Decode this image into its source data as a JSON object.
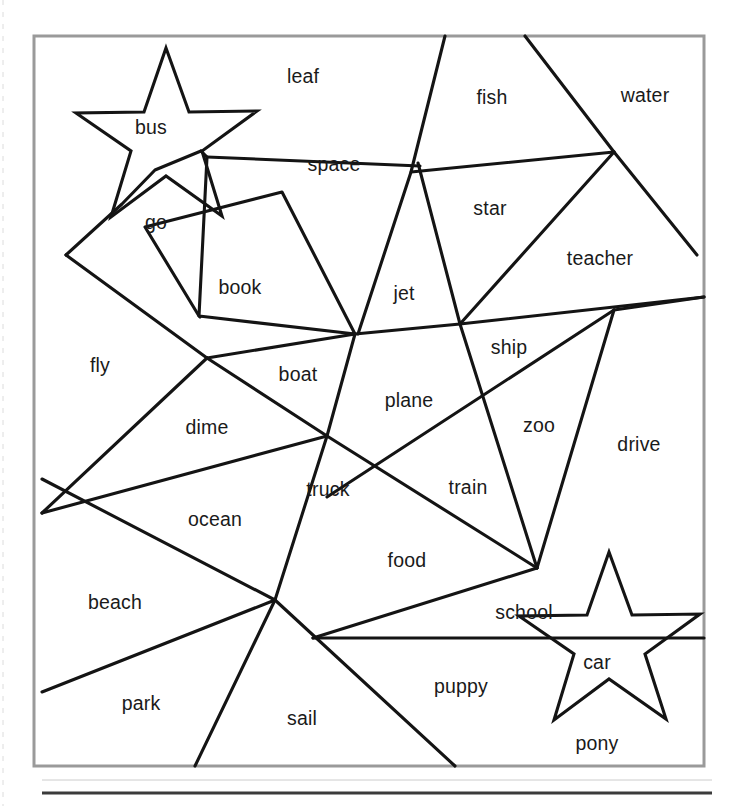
{
  "document": {
    "type": "worksheet",
    "title": "Shape Word Puzzle",
    "background_color": "#ffffff",
    "frame": {
      "x": 34,
      "y": 36,
      "width": 670,
      "height": 730,
      "stroke_color": "#9a9a9a",
      "stroke_width": 3
    },
    "line_color": "#141414",
    "line_width": 3.1,
    "text_color": "#1a1a1a",
    "footer_rule": {
      "x1": 42,
      "y1": 793,
      "x2": 712,
      "y2": 793,
      "color": "#3b3b3b"
    }
  },
  "words": [
    {
      "id": "bus",
      "label": "bus",
      "x": 151,
      "y": 129
    },
    {
      "id": "leaf",
      "label": "leaf",
      "x": 303,
      "y": 78
    },
    {
      "id": "fish",
      "label": "fish",
      "x": 492,
      "y": 99
    },
    {
      "id": "water",
      "label": "water",
      "x": 645,
      "y": 97
    },
    {
      "id": "space",
      "label": "space",
      "x": 334,
      "y": 166
    },
    {
      "id": "star",
      "label": "star",
      "x": 490,
      "y": 210
    },
    {
      "id": "teacher",
      "label": "teacher",
      "x": 600,
      "y": 260
    },
    {
      "id": "go",
      "label": "go",
      "x": 156,
      "y": 224
    },
    {
      "id": "book",
      "label": "book",
      "x": 240,
      "y": 289
    },
    {
      "id": "jet",
      "label": "jet",
      "x": 404,
      "y": 295
    },
    {
      "id": "ship",
      "label": "ship",
      "x": 509,
      "y": 349
    },
    {
      "id": "fly",
      "label": "fly",
      "x": 100,
      "y": 367
    },
    {
      "id": "boat",
      "label": "boat",
      "x": 298,
      "y": 376
    },
    {
      "id": "plane",
      "label": "plane",
      "x": 409,
      "y": 402
    },
    {
      "id": "dime",
      "label": "dime",
      "x": 207,
      "y": 429
    },
    {
      "id": "zoo",
      "label": "zoo",
      "x": 539,
      "y": 427
    },
    {
      "id": "drive",
      "label": "drive",
      "x": 639,
      "y": 446
    },
    {
      "id": "truck",
      "label": "truck",
      "x": 328,
      "y": 491
    },
    {
      "id": "train",
      "label": "train",
      "x": 468,
      "y": 489
    },
    {
      "id": "ocean",
      "label": "ocean",
      "x": 215,
      "y": 521
    },
    {
      "id": "food",
      "label": "food",
      "x": 407,
      "y": 562
    },
    {
      "id": "beach",
      "label": "beach",
      "x": 115,
      "y": 604
    },
    {
      "id": "school",
      "label": "school",
      "x": 524,
      "y": 614
    },
    {
      "id": "car",
      "label": "car",
      "x": 597,
      "y": 664
    },
    {
      "id": "park",
      "label": "park",
      "x": 141,
      "y": 705
    },
    {
      "id": "puppy",
      "label": "puppy",
      "x": 461,
      "y": 688
    },
    {
      "id": "sail",
      "label": "sail",
      "x": 302,
      "y": 720
    },
    {
      "id": "pony",
      "label": "pony",
      "x": 597,
      "y": 745
    }
  ],
  "shapes": [
    {
      "id": "star-top",
      "name": "star-shape-top",
      "points": "166,48 189,112 257,111 202,151 222,216 166,176 111,217 131,151 76,113 144,112"
    },
    {
      "id": "star-bottom",
      "name": "star-shape-bottom",
      "points": "609,552 632,615 700,614 645,654 666,719 609,679 554,720 574,654 519,616 587,615"
    }
  ],
  "lines": [
    {
      "id": "l1",
      "name": "segment-top-left-to-space",
      "d": "M 66,255 L 122,204 L 155,170 L 201,151"
    },
    {
      "id": "l2",
      "name": "segment-space-outline",
      "d": "M 201,151 L 207,157 L 199,316 L 200,317"
    },
    {
      "id": "l3",
      "name": "segment-space-top",
      "d": "M 207,157 L 420,166"
    },
    {
      "id": "l4",
      "name": "segment-book-quad",
      "d": "M 145,227 L 199,316 L 355,334 L 282,192 Z"
    },
    {
      "id": "l5",
      "name": "segment-fish-left",
      "d": "M 445,36 L 411,172 L 358,334"
    },
    {
      "id": "l6",
      "name": "segment-water-left",
      "d": "M 525,36 L 614,152 L 697,255"
    },
    {
      "id": "l7",
      "name": "segment-fish-bottom",
      "d": "M 411,172 L 614,152"
    },
    {
      "id": "l8",
      "name": "segment-star-jet",
      "d": "M 418,163 L 460,324"
    },
    {
      "id": "l9",
      "name": "segment-long-horizontal",
      "d": "M 66,255 L 207,358"
    },
    {
      "id": "l10",
      "name": "segment-teacher-diagonal",
      "d": "M 614,152 L 460,324"
    },
    {
      "id": "l11",
      "name": "segment-mid-horizontal",
      "d": "M 207,358 L 355,334 L 460,324 L 704,297"
    },
    {
      "id": "l12",
      "name": "segment-ship-fan",
      "d": "M 460,324 L 537,568"
    },
    {
      "id": "l13",
      "name": "segment-drive-left",
      "d": "M 614,310 L 537,568"
    },
    {
      "id": "l14",
      "name": "segment-zoo-diagonal",
      "d": "M 614,310 L 327,497"
    },
    {
      "id": "l15",
      "name": "segment-boat-dime",
      "d": "M 207,358 L 327,436"
    },
    {
      "id": "l16",
      "name": "segment-plane-left",
      "d": "M 355,334 L 327,436 L 275,600"
    },
    {
      "id": "l17",
      "name": "segment-dime-ocean",
      "d": "M 42,513 L 327,436"
    },
    {
      "id": "l18",
      "name": "segment-fly-ocean",
      "d": "M 42,513 L 207,358"
    },
    {
      "id": "l19",
      "name": "segment-ocean-beach",
      "d": "M 42,479 L 275,600"
    },
    {
      "id": "l20",
      "name": "segment-beach-park",
      "d": "M 42,692 L 275,600"
    },
    {
      "id": "l21",
      "name": "segment-park-sail",
      "d": "M 275,600 L 195,766"
    },
    {
      "id": "l22",
      "name": "segment-sail-puppy",
      "d": "M 275,600 L 455,766"
    },
    {
      "id": "l23",
      "name": "segment-truck-food",
      "d": "M 327,436 L 537,568"
    },
    {
      "id": "l24",
      "name": "segment-food-school",
      "d": "M 537,568 L 313,638"
    },
    {
      "id": "l25",
      "name": "segment-school-bottom",
      "d": "M 313,638 L 704,638"
    },
    {
      "id": "l26",
      "name": "segment-plane-branch",
      "d": "M 614,310 L 704,297"
    }
  ]
}
